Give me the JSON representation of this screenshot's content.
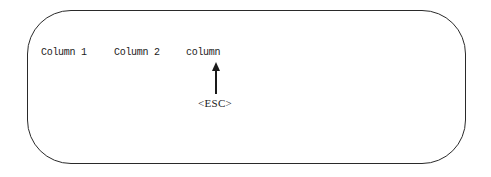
{
  "diagram": {
    "columns": [
      "Column 1",
      "Column 2",
      "column"
    ],
    "key_label": "<ESC>",
    "arrow_target": "column",
    "stroke_color": "#2a2a2a"
  }
}
